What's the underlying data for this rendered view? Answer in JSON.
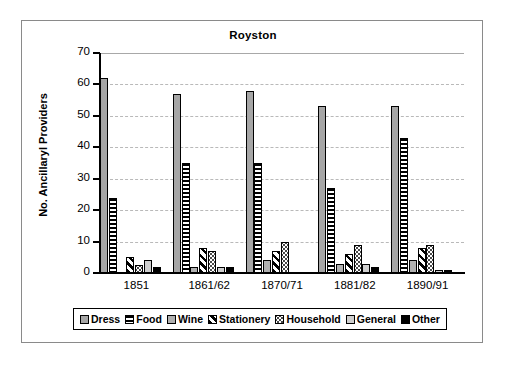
{
  "chart_data": {
    "type": "bar",
    "title": "Royston",
    "xlabel": "",
    "ylabel": "No. Ancillaryl Providers",
    "ylim": [
      0,
      70
    ],
    "ytick_step": 10,
    "yticks": [
      "70",
      "60",
      "50",
      "40",
      "30",
      "20",
      "10",
      "0"
    ],
    "grid": true,
    "legend_position": "bottom",
    "categories": [
      "1851",
      "1861/62",
      "1870/71",
      "1881/82",
      "1890/91"
    ],
    "series": [
      {
        "name": "Dress",
        "pattern": "solid-gray",
        "color": "#a6a6a6",
        "values": [
          62,
          57,
          58,
          53,
          53
        ]
      },
      {
        "name": "Food",
        "pattern": "horizontal-stripes",
        "color": "#000000",
        "values": [
          24,
          35,
          35,
          27,
          43
        ]
      },
      {
        "name": "Wine",
        "pattern": "solid-gray",
        "color": "#b0b0b0",
        "values": [
          0,
          2,
          4,
          3,
          4
        ]
      },
      {
        "name": "Stationery",
        "pattern": "diagonal-stripes",
        "color": "#000000",
        "values": [
          5,
          8,
          7,
          6,
          8
        ]
      },
      {
        "name": "Household",
        "pattern": "dotted",
        "color": "#4a4a4a",
        "values": [
          2.5,
          7,
          10,
          9,
          9
        ]
      },
      {
        "name": "General",
        "pattern": "solid-light-gray",
        "color": "#cfcfcf",
        "values": [
          4,
          2,
          0,
          3,
          1
        ]
      },
      {
        "name": "Other",
        "pattern": "solid-black",
        "color": "#000000",
        "values": [
          2,
          2,
          0,
          2,
          1
        ]
      }
    ]
  },
  "legend": {
    "items": [
      {
        "label": "Dress"
      },
      {
        "label": "Food"
      },
      {
        "label": "Wine"
      },
      {
        "label": "Stationery"
      },
      {
        "label": "Household"
      },
      {
        "label": "General"
      },
      {
        "label": "Other"
      }
    ]
  }
}
